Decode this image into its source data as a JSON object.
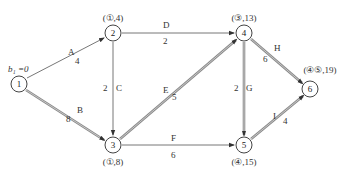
{
  "diagram": {
    "type": "network-shortest-path",
    "start_label": "b₁ =0",
    "nodes": [
      {
        "id": "1",
        "label": "1",
        "x": 19,
        "y": 84,
        "mark": ""
      },
      {
        "id": "2",
        "label": "2",
        "x": 113,
        "y": 33,
        "mark": "(①,4)"
      },
      {
        "id": "3",
        "label": "3",
        "x": 113,
        "y": 145,
        "mark": "(①,8)"
      },
      {
        "id": "4",
        "label": "4",
        "x": 244,
        "y": 33,
        "mark": "(③,13)"
      },
      {
        "id": "5",
        "label": "5",
        "x": 244,
        "y": 145,
        "mark": "(④,15)"
      },
      {
        "id": "6",
        "label": "6",
        "x": 310,
        "y": 89,
        "mark": "(④⑤,19)"
      }
    ],
    "edges": [
      {
        "from": "1",
        "to": "2",
        "name": "A",
        "weight": "4",
        "critical": false
      },
      {
        "from": "1",
        "to": "3",
        "name": "B",
        "weight": "8",
        "critical": true
      },
      {
        "from": "2",
        "to": "4",
        "name": "D",
        "weight": "2",
        "critical": false
      },
      {
        "from": "2",
        "to": "3",
        "name": "C",
        "weight": "2",
        "critical": false
      },
      {
        "from": "3",
        "to": "4",
        "name": "E",
        "weight": "5",
        "critical": true
      },
      {
        "from": "3",
        "to": "5",
        "name": "F",
        "weight": "6",
        "critical": false
      },
      {
        "from": "4",
        "to": "5",
        "name": "G",
        "weight": "2",
        "critical": true
      },
      {
        "from": "4",
        "to": "6",
        "name": "H",
        "weight": "6",
        "critical": true
      },
      {
        "from": "5",
        "to": "6",
        "name": "I",
        "weight": "4",
        "critical": true
      }
    ]
  },
  "labels": {
    "start": "b₁ =0",
    "n1": "1",
    "n2": "2",
    "n3": "3",
    "n4": "4",
    "n5": "5",
    "n6": "6",
    "m2": "(①,4)",
    "m3": "(①,8)",
    "m4": "(③,13)",
    "m5": "(④,15)",
    "m6": "(④⑤,19)",
    "eA": "A",
    "wA": "4",
    "eB": "B",
    "wB": "8",
    "eC": "C",
    "wC": "2",
    "eD": "D",
    "wD": "2",
    "eE": "E",
    "wE": "5",
    "eF": "F",
    "wF": "6",
    "eG": "G",
    "wG": "2",
    "eH": "H",
    "wH": "6",
    "eI": "I",
    "wI": "4"
  }
}
